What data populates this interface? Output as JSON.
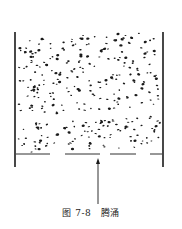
{
  "figure": {
    "caption_number": "图 7-8",
    "caption_title": "腾涌",
    "colors": {
      "ink": "#1a1a1a",
      "background": "#ffffff"
    },
    "vessel": {
      "left_x": 15,
      "right_x": 163,
      "top_y": 32,
      "bottom_y": 167
    },
    "distributor": {
      "y": 154,
      "segments": [
        [
          16,
          50
        ],
        [
          65,
          100
        ],
        [
          110,
          136
        ],
        [
          150,
          162
        ]
      ]
    },
    "arrow": {
      "x": 98,
      "from_y": 204,
      "to_y": 158,
      "direction": "up"
    },
    "particle_layers": [
      {
        "name": "top-slug",
        "y_top": 35,
        "y_bottom": 73,
        "count": 110
      },
      {
        "name": "middle-slug",
        "y_top": 76,
        "y_bottom": 112,
        "count": 110
      },
      {
        "name": "bottom-slug",
        "y_top": 120,
        "y_bottom": 150,
        "count": 100
      }
    ]
  }
}
